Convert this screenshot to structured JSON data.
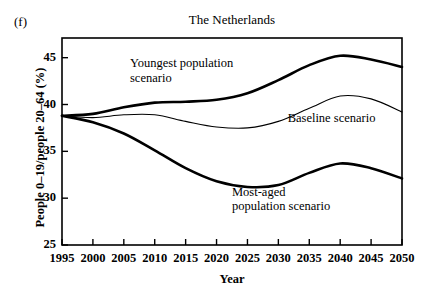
{
  "figure": {
    "panel_label": "(f)",
    "title": "The Netherlands"
  },
  "chart_data": {
    "type": "line",
    "title": "The Netherlands",
    "xlabel": "Year",
    "ylabel": "People 0–19/people 20–64 (%)",
    "xlim": [
      1995,
      2050
    ],
    "ylim": [
      25,
      47.1
    ],
    "xticks": [
      1995,
      2000,
      2005,
      2010,
      2015,
      2020,
      2025,
      2030,
      2035,
      2040,
      2045,
      2050
    ],
    "yticks": [
      25,
      30,
      35,
      40,
      45
    ],
    "grid": false,
    "legend_position": "inline-annotations",
    "x": [
      1995,
      2000,
      2005,
      2010,
      2015,
      2020,
      2025,
      2030,
      2035,
      2040,
      2045,
      2050
    ],
    "series": [
      {
        "name": "Youngest population scenario",
        "label": "Youngest population\nscenario",
        "color": "#000000",
        "linewidth": 2.6,
        "values": [
          38.8,
          39.0,
          39.7,
          40.2,
          40.3,
          40.5,
          41.2,
          42.6,
          44.2,
          45.2,
          44.8,
          44.0
        ]
      },
      {
        "name": "Baseline scenario",
        "label": "Baseline scenario",
        "color": "#000000",
        "linewidth": 1.1,
        "values": [
          38.8,
          38.6,
          38.9,
          38.9,
          38.2,
          37.6,
          37.5,
          38.2,
          39.6,
          40.9,
          40.6,
          39.2
        ]
      },
      {
        "name": "Most-aged population scenario",
        "label": "Most-aged\npopulation scenario",
        "color": "#000000",
        "linewidth": 2.6,
        "values": [
          38.8,
          38.1,
          36.9,
          35.1,
          33.2,
          31.8,
          31.2,
          31.4,
          32.7,
          33.7,
          33.2,
          32.1
        ]
      }
    ],
    "annotations": [
      {
        "text": "Youngest population\nscenario",
        "x": 2006.0,
        "y": 44.3
      },
      {
        "text": "Baseline scenario",
        "x": 2031.5,
        "y": 38.5
      },
      {
        "text": "Most-aged\npopulation scenario",
        "x": 2022.5,
        "y": 30.6
      }
    ]
  },
  "axes": {
    "y_tick_labels": [
      "45",
      "40",
      "35",
      "30",
      "25"
    ],
    "x_tick_labels": [
      "1995",
      "2000",
      "2005",
      "2010",
      "2015",
      "2020",
      "2025",
      "2030",
      "2035",
      "2040",
      "2045",
      "2050"
    ],
    "y_axis_title": "People 0–19/people 20–64 (%)",
    "x_axis_title": "Year"
  },
  "colors": {
    "ink": "#000000",
    "background": "#ffffff"
  }
}
